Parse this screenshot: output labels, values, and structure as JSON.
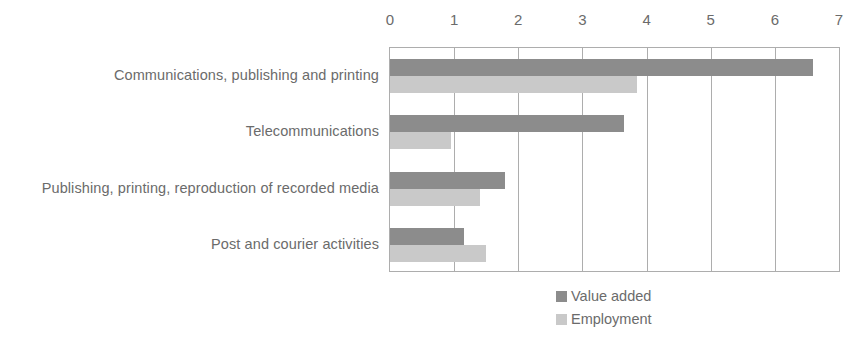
{
  "chart_data": {
    "type": "bar",
    "orientation": "horizontal",
    "title": "",
    "subtitle": "",
    "xlabel": "",
    "ylabel": "",
    "xlim": [
      0,
      7
    ],
    "xticks": [
      0,
      1,
      2,
      3,
      4,
      5,
      6,
      7
    ],
    "grid": true,
    "legend_position": "bottom",
    "categories": [
      "Communications, publishing and printing",
      "Telecommunications",
      "Publishing, printing, reproduction of recorded media",
      "Post and courier activities"
    ],
    "series": [
      {
        "name": "Value added",
        "color": "#8c8c8c",
        "values": [
          6.6,
          3.65,
          1.8,
          1.15
        ]
      },
      {
        "name": "Employment",
        "color": "#c9c9c9",
        "values": [
          3.85,
          0.95,
          1.4,
          1.5
        ]
      }
    ]
  },
  "legend": {
    "items": [
      {
        "label": "Value added",
        "swatch": "legend-swatch-value-added"
      },
      {
        "label": "Employment",
        "swatch": "legend-swatch-employment"
      }
    ]
  },
  "axis": {
    "tick_labels": [
      "0",
      "1",
      "2",
      "3",
      "4",
      "5",
      "6",
      "7"
    ]
  },
  "colors": {
    "series_value_added": "#8c8c8c",
    "series_employment": "#c9c9c9",
    "axis_line": "#adadad",
    "text": "#6b6b6b",
    "background": "#ffffff"
  }
}
